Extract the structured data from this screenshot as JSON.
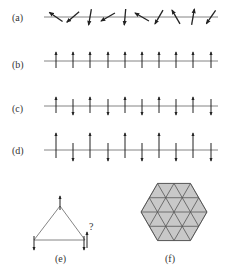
{
  "panels": {
    "a": {
      "label": "(a)",
      "description": "random spin orientations (paramagnet)",
      "line_y": 17,
      "angles_deg": [
        -145,
        140,
        100,
        150,
        95,
        -150,
        120,
        -120,
        -80,
        125
      ]
    },
    "b": {
      "label": "(b)",
      "description": "ferromagnetic chain",
      "line_y": 61,
      "spins": [
        "up",
        "up",
        "up",
        "up",
        "up",
        "up",
        "up",
        "up",
        "up",
        "up"
      ]
    },
    "c": {
      "label": "(c)",
      "description": "antiferromagnetic chain",
      "line_y": 106,
      "spins": [
        "up",
        "down",
        "up",
        "down",
        "up",
        "down",
        "up",
        "down",
        "up",
        "down"
      ]
    },
    "d": {
      "label": "(d)",
      "description": "ferrimagnetic chain",
      "line_y": 150,
      "spins": [
        "up",
        "down",
        "up",
        "down",
        "up",
        "down",
        "up",
        "down",
        "up",
        "down"
      ]
    },
    "e": {
      "label": "(e)",
      "description": "frustrated triangle",
      "question_mark": "?"
    },
    "f": {
      "label": "(f)",
      "description": "triangular lattice hexagon"
    }
  },
  "colors": {
    "line": "#555555",
    "arrow": "#222222",
    "hex_fill": "#c8c8c8",
    "hex_stroke": "#555555"
  },
  "site_x": [
    56,
    73,
    90,
    108,
    125,
    142,
    159,
    176,
    193,
    211
  ]
}
